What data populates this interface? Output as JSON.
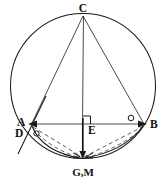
{
  "figure": {
    "type": "geometry-diagram",
    "background_color": "#ffffff",
    "stroke_color": "#1a1a1a",
    "dash_color": "#4a4a4a",
    "labels": {
      "c": "C",
      "a": "A",
      "b": "B",
      "d": "D",
      "e": "E",
      "gm": "G,M"
    },
    "points": {
      "c": {
        "x": 83,
        "y": 15
      },
      "a": {
        "x": 32,
        "y": 124
      },
      "b": {
        "x": 144,
        "y": 124
      },
      "e": {
        "x": 83,
        "y": 124
      },
      "gm": {
        "x": 83,
        "y": 158
      },
      "d": {
        "x": 27,
        "y": 132
      },
      "center": {
        "x": 83,
        "y": 86
      }
    },
    "circle": {
      "cx": 83,
      "cy": 86,
      "r": 73
    },
    "segments": [
      {
        "name": "chord-CA",
        "from": "C",
        "to": "A",
        "style": "solid"
      },
      {
        "name": "chord-CB",
        "from": "C",
        "to": "B",
        "style": "solid"
      },
      {
        "name": "altitude-CE-GM",
        "from": "C",
        "to": "G,M",
        "style": "solid"
      },
      {
        "name": "chord-AB",
        "from": "A",
        "to": "B",
        "style": "solid-double-arrow"
      },
      {
        "name": "chord-A-GM",
        "from": "A",
        "to": "G,M",
        "style": "dashed"
      },
      {
        "name": "chord-GM-B",
        "from": "G,M",
        "to": "B",
        "style": "dashed"
      },
      {
        "name": "line-through-A-D",
        "from": "D",
        "to": "beyond-A",
        "style": "solid"
      }
    ],
    "marks": {
      "right_angle_at_e": "right-angle-square",
      "angle_at_a": "small-circle",
      "angle_at_b": "small-circle",
      "angle_at_d": "small-circle"
    }
  }
}
